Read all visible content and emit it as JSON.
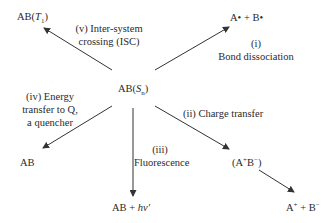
{
  "diagram": {
    "center": {
      "prefix": "AB(",
      "symbol": "S",
      "sub": "n",
      "suffix": ")"
    },
    "products": {
      "triplet": {
        "prefix": "AB(",
        "symbol": "T",
        "sub": "1",
        "suffix": ")"
      },
      "radicals": "A• + B•",
      "quenched": "AB",
      "fluorescence": {
        "prefix": "AB + ",
        "symbol": "hν′"
      },
      "ion_pair": {
        "open": "(A",
        "plus": "+",
        "mid": "B",
        "minus": "−",
        "close": ")"
      },
      "ions": {
        "a": "A",
        "plus": "+",
        "mid": " + B",
        "minus": "−"
      }
    },
    "processes": {
      "i": {
        "line1": "(i)",
        "line2": "Bond dissociation"
      },
      "ii": {
        "line1": "(ii) Charge transfer"
      },
      "iii": {
        "line1": "(iii)",
        "line2": "Fluorescence"
      },
      "iv": {
        "line1": "(iv) Energy",
        "line2": "transfer to Q,",
        "line3": "a quencher"
      },
      "v": {
        "line1": "(v) Inter-system",
        "line2": "crossing (ISC)"
      }
    },
    "colors": {
      "text": "#2a2a2a",
      "arrow": "#333333",
      "background": "#ffffff"
    }
  }
}
